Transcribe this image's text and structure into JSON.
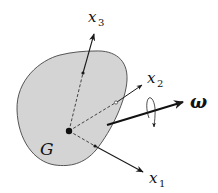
{
  "labels": {
    "center": "G",
    "omega": "ω",
    "x1": {
      "base": "x",
      "sub": "1"
    },
    "x2": {
      "base": "x",
      "sub": "2"
    },
    "x3": {
      "base": "x",
      "sub": "3"
    }
  },
  "colors": {
    "body_fill": "#d4d4d4",
    "stroke": "#1a1a1a",
    "background": "#ffffff"
  }
}
